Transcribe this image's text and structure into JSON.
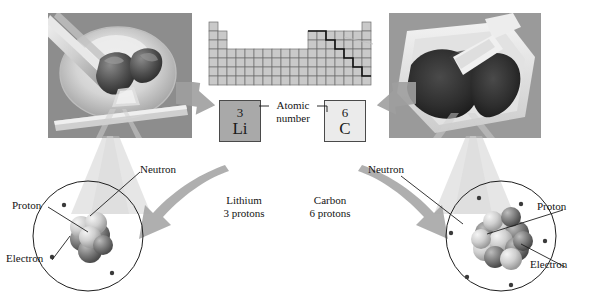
{
  "figure": {
    "background_color": "#ffffff"
  },
  "periodic_table": {
    "name": "periodic-table",
    "highlight_note": "metalloid staircase line",
    "rows": 7,
    "columns": 18,
    "cell_fill": "#c9c9c9",
    "cell_stroke": "#6e6e6e",
    "staircase_color": "#111111"
  },
  "photos": [
    {
      "id": "lithium-photo",
      "caption": "Lithium metal being cut on a dish",
      "tone": "#8f8f8f"
    },
    {
      "id": "carbon-photo",
      "caption": "Carbon powder in a weighing boat with a scoop",
      "tone": "#5a5a5a"
    }
  ],
  "elements": {
    "lithium": {
      "atomic_number": "3",
      "symbol": "Li",
      "box_fill": "#a9a9a9",
      "name_label": "Lithium",
      "proton_label": "3 protons"
    },
    "carbon": {
      "atomic_number": "6",
      "symbol": "C",
      "box_fill": "#ebebeb",
      "name_label": "Carbon",
      "proton_label": "6 protons"
    }
  },
  "annotations": {
    "atomic_number_label_line1": "Atomic",
    "atomic_number_label_line2": "number"
  },
  "atom_lithium": {
    "id": "lithium-atom-diagram",
    "neutron_label": "Neutron",
    "proton_label": "Proton",
    "electron_label": "Electron",
    "electron_count": 3,
    "nucleus_particles": 7
  },
  "atom_carbon": {
    "id": "carbon-atom-diagram",
    "neutron_label": "Neutron",
    "proton_label": "Proton",
    "electron_label": "Electron",
    "electron_count": 6,
    "nucleus_particles": 12
  },
  "colors": {
    "line": "#141414",
    "arrow_gray": "#a0a0a0",
    "beam_gray": "#bdbdbd",
    "proton_dark": "#6f6f6f",
    "neutron_light": "#d2d2d2"
  }
}
